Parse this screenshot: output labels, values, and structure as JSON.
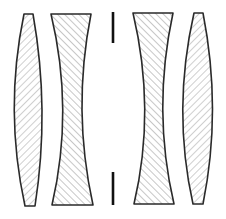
{
  "diagram": {
    "colors": {
      "background": "#ffffff",
      "outline": "#2a2a2a",
      "hatch": "#9a9a9a",
      "stop": "#111111"
    },
    "elements": [
      {
        "id": "lens-1",
        "type": "biconvex",
        "hatch": "forward-slash"
      },
      {
        "id": "lens-2",
        "type": "biconcave",
        "hatch": "back-slash"
      },
      {
        "id": "aperture-stop",
        "type": "stop"
      },
      {
        "id": "lens-3",
        "type": "biconcave",
        "hatch": "back-slash"
      },
      {
        "id": "lens-4",
        "type": "biconvex",
        "hatch": "forward-slash"
      }
    ]
  }
}
